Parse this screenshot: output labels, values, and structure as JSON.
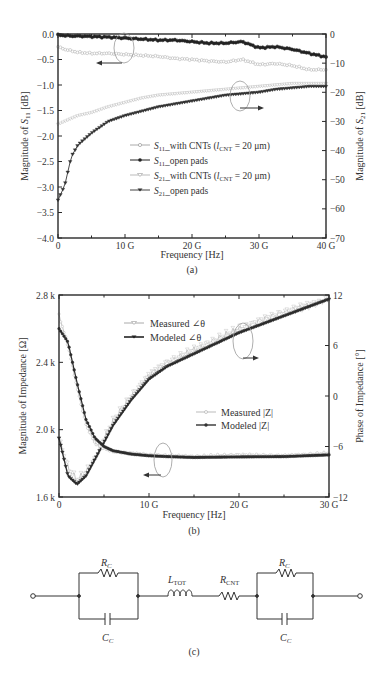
{
  "chart_data": [
    {
      "type": "line",
      "panel_label": "(a)",
      "xlabel": "Frequency [Hz]",
      "ylabel": "Magnitude of S11 [dB]",
      "ylabel_right": "Magnitude of S21 [dB]",
      "xlim": [
        0,
        40
      ],
      "ylim": [
        -4.0,
        0.0
      ],
      "ylim_right": [
        -70,
        0
      ],
      "x_ticks": [
        "0",
        "10 G",
        "20 G",
        "30 G",
        "40 G"
      ],
      "y_ticks": [
        "0.0",
        "−0.5",
        "−1.0",
        "−1.5",
        "−2.0",
        "−2.5",
        "−3.0",
        "−3.5",
        "−4.0"
      ],
      "y_ticks_right": [
        "0",
        "−10",
        "−20",
        "−30",
        "−40",
        "−50",
        "−60",
        "−70"
      ],
      "legend": [
        "S11_with CNTs (lCNT = 20 μm)",
        "S11_open pads",
        "S21_with CNTs (lCNT = 20 μm)",
        "S21_open pads"
      ],
      "x": [
        0,
        1,
        2,
        3,
        5,
        7.5,
        10,
        12.5,
        15,
        17.5,
        20,
        22.5,
        25,
        27.5,
        30,
        32.5,
        35,
        37.5,
        40
      ],
      "series": [
        {
          "name": "S11_with CNTs (lCNT = 20 μm)",
          "axis": "left",
          "values": [
            -0.25,
            -0.3,
            -0.33,
            -0.36,
            -0.38,
            -0.38,
            -0.4,
            -0.42,
            -0.44,
            -0.48,
            -0.5,
            -0.53,
            -0.55,
            -0.5,
            -0.6,
            -0.58,
            -0.62,
            -0.7,
            -0.7
          ]
        },
        {
          "name": "S11_open pads",
          "axis": "left",
          "values": [
            -0.02,
            -0.03,
            -0.04,
            -0.04,
            -0.05,
            -0.06,
            -0.08,
            -0.1,
            -0.12,
            -0.12,
            -0.15,
            -0.18,
            -0.18,
            -0.15,
            -0.27,
            -0.25,
            -0.3,
            -0.38,
            -0.45
          ]
        },
        {
          "name": "S21_with CNTs (lCNT = 20 μm)",
          "axis": "right",
          "values": [
            -31,
            -30,
            -29,
            -28,
            -27,
            -25,
            -23.5,
            -22,
            -21,
            -20.5,
            -20,
            -19.5,
            -19,
            -18.5,
            -18,
            -17.5,
            -17,
            -17,
            -17
          ]
        },
        {
          "name": "S21_open pads",
          "axis": "right",
          "values": [
            -57,
            -52,
            -42,
            -38,
            -34,
            -30,
            -28,
            -26.5,
            -25,
            -24,
            -23,
            -22,
            -21,
            -20.5,
            -20,
            -19,
            -18.5,
            -18,
            -18
          ]
        }
      ]
    },
    {
      "type": "line",
      "panel_label": "(b)",
      "xlabel": "Frequency [Hz]",
      "ylabel": "Magnitude of Impedance [Ω]",
      "ylabel_right": "Phase of Impedance [°]",
      "xlim": [
        0,
        30
      ],
      "ylim": [
        1600,
        2800
      ],
      "ylim_right": [
        -12,
        12
      ],
      "x_ticks": [
        "0",
        "10 G",
        "20 G",
        "30 G"
      ],
      "y_ticks": [
        "2.8 k",
        "2.4 k",
        "2.0 k",
        "1.6 k"
      ],
      "y_ticks_right": [
        "12",
        "6",
        "0",
        "−6",
        "−12"
      ],
      "legend": [
        "Measured ∠θ",
        "Modeled ∠θ",
        "Measured |Z|",
        "Modeled |Z|"
      ],
      "x": [
        0,
        1,
        2,
        3,
        4,
        5,
        6,
        8,
        10,
        12,
        15,
        20,
        25,
        30
      ],
      "series": [
        {
          "name": "Measured ∠θ",
          "axis": "right",
          "values": [
            -5,
            -8.5,
            -10,
            -9,
            -7.5,
            -5,
            -3,
            0,
            2.5,
            4,
            5.5,
            8,
            10,
            11.5
          ]
        },
        {
          "name": "Modeled ∠θ",
          "axis": "right",
          "values": [
            -5,
            -9.5,
            -10.5,
            -9.5,
            -7.5,
            -5.5,
            -3.5,
            -0.5,
            2,
            3.5,
            5,
            7.5,
            9.5,
            11.5
          ]
        },
        {
          "name": "Measured |Z|",
          "axis": "left",
          "values": [
            2680,
            2500,
            2250,
            2030,
            1920,
            1890,
            1870,
            1860,
            1850,
            1845,
            1840,
            1850,
            1845,
            1860
          ]
        },
        {
          "name": "Modeled |Z|",
          "axis": "left",
          "values": [
            2600,
            2520,
            2280,
            2060,
            1950,
            1900,
            1875,
            1855,
            1845,
            1840,
            1835,
            1838,
            1840,
            1850
          ]
        }
      ]
    }
  ],
  "panels": {
    "a": {
      "label": "(a)",
      "xlabel": "Frequency [Hz]",
      "ylabel_left": "Magnitude of S11 [dB]",
      "ylabel_right": "Magnitude of S21 [dB]",
      "legend": [
        "S11_with CNTs (lCNT = 20 μm)",
        "S11_open pads",
        "S21_with CNTs (lCNT = 20 μm)",
        "S21_open pads"
      ]
    },
    "b": {
      "label": "(b)",
      "xlabel": "Frequency [Hz]",
      "ylabel_left": "Magnitude of Impedance [Ω]",
      "ylabel_right": "Phase of Impedance [°]",
      "legend": [
        "Measured ∠θ",
        "Modeled ∠θ",
        "Measured |Z|",
        "Modeled |Z|"
      ]
    },
    "c": {
      "label": "(c)",
      "components": [
        "RC",
        "CC",
        "LTOT",
        "RCNT",
        "RC",
        "CC"
      ]
    }
  },
  "colors": {
    "axis": "#2a2a2a",
    "s11_cnt": "#a8a8a8",
    "s11_open": "#222222",
    "s21_cnt": "#b0b0b0",
    "s21_open": "#333333",
    "measured": "#b5b5b5",
    "modeled": "#2c2c2c"
  }
}
